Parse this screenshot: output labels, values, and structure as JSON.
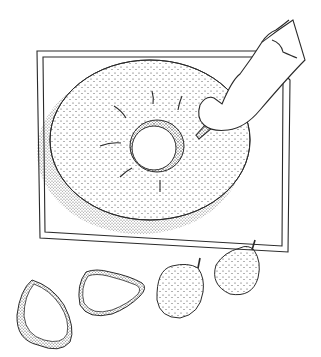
{
  "illustration": {
    "subject": "Stippled pen drawing of a ring cake on a tray being cut, with pears",
    "colors": {
      "background": "#ffffff",
      "ink": "#2a2a2a"
    },
    "elements": [
      {
        "name": "tray"
      },
      {
        "name": "ring-cake"
      },
      {
        "name": "hand-with-knife"
      },
      {
        "name": "pear-half-1"
      },
      {
        "name": "pear-half-2"
      },
      {
        "name": "pear-whole-1"
      },
      {
        "name": "pear-whole-2"
      }
    ]
  }
}
